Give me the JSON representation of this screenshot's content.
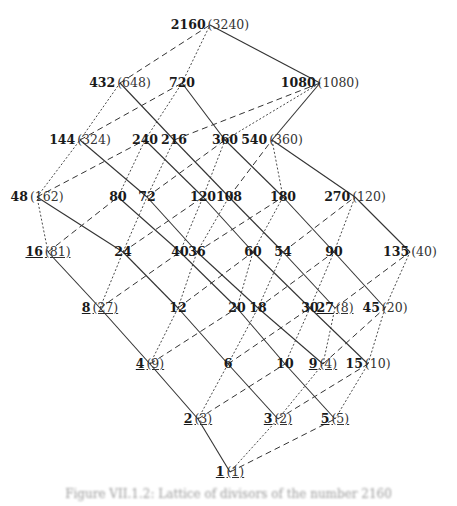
{
  "diagram": {
    "edge_styles": {
      "factor_2": "solid",
      "factor_3": "dotted",
      "factor_5": "dashed"
    },
    "nodes": [
      {
        "id": "2160",
        "label": "2160",
        "alt": "(3240)",
        "x": 210,
        "y": 25,
        "ul": false,
        "alt_ul": false
      },
      {
        "id": "432",
        "label": "432",
        "alt": "(648)",
        "x": 120,
        "y": 83,
        "ul": false,
        "alt_ul": false
      },
      {
        "id": "720",
        "label": "720",
        "alt": "",
        "x": 182,
        "y": 83,
        "ul": false,
        "alt_ul": false
      },
      {
        "id": "1080",
        "label": "1080",
        "alt": "(1080)",
        "x": 320,
        "y": 83,
        "ul": false,
        "alt_ul": false
      },
      {
        "id": "144",
        "label": "144",
        "alt": "(324)",
        "x": 80,
        "y": 140,
        "ul": false,
        "alt_ul": false
      },
      {
        "id": "240",
        "label": "240",
        "alt": "",
        "x": 145,
        "y": 140,
        "ul": false,
        "alt_ul": false
      },
      {
        "id": "216",
        "label": "216",
        "alt": "",
        "x": 174,
        "y": 140,
        "ul": false,
        "alt_ul": false
      },
      {
        "id": "360",
        "label": "360",
        "alt": "",
        "x": 225,
        "y": 140,
        "ul": false,
        "alt_ul": false
      },
      {
        "id": "540",
        "label": "540",
        "alt": "(360)",
        "x": 272,
        "y": 140,
        "ul": false,
        "alt_ul": false
      },
      {
        "id": "48",
        "label": "48",
        "alt": "(162)",
        "x": 37,
        "y": 197,
        "ul": false,
        "alt_ul": false
      },
      {
        "id": "80",
        "label": "80",
        "alt": "",
        "x": 118,
        "y": 197,
        "ul": false,
        "alt_ul": false
      },
      {
        "id": "72",
        "label": "72",
        "alt": "",
        "x": 147,
        "y": 197,
        "ul": false,
        "alt_ul": false
      },
      {
        "id": "120",
        "label": "120",
        "alt": "",
        "x": 203,
        "y": 197,
        "ul": false,
        "alt_ul": false
      },
      {
        "id": "108",
        "label": "108",
        "alt": "",
        "x": 229,
        "y": 197,
        "ul": false,
        "alt_ul": false
      },
      {
        "id": "180",
        "label": "180",
        "alt": "",
        "x": 283,
        "y": 197,
        "ul": false,
        "alt_ul": false
      },
      {
        "id": "270",
        "label": "270",
        "alt": "(120)",
        "x": 355,
        "y": 197,
        "ul": false,
        "alt_ul": false
      },
      {
        "id": "16",
        "label": "16",
        "alt": "(81)",
        "x": 48,
        "y": 252,
        "ul": true,
        "alt_ul": true
      },
      {
        "id": "24",
        "label": "24",
        "alt": "",
        "x": 123,
        "y": 252,
        "ul": false,
        "alt_ul": false
      },
      {
        "id": "40",
        "label": "40",
        "alt": "",
        "x": 180,
        "y": 252,
        "ul": false,
        "alt_ul": false
      },
      {
        "id": "36",
        "label": "36",
        "alt": "",
        "x": 197,
        "y": 252,
        "ul": false,
        "alt_ul": false
      },
      {
        "id": "60",
        "label": "60",
        "alt": "",
        "x": 253,
        "y": 252,
        "ul": false,
        "alt_ul": false
      },
      {
        "id": "54",
        "label": "54",
        "alt": "",
        "x": 283,
        "y": 252,
        "ul": false,
        "alt_ul": false
      },
      {
        "id": "90",
        "label": "90",
        "alt": "",
        "x": 334,
        "y": 252,
        "ul": false,
        "alt_ul": false
      },
      {
        "id": "135",
        "label": "135",
        "alt": "(40)",
        "x": 410,
        "y": 252,
        "ul": false,
        "alt_ul": false
      },
      {
        "id": "8",
        "label": "8",
        "alt": "(27)",
        "x": 100,
        "y": 308,
        "ul": true,
        "alt_ul": true
      },
      {
        "id": "12",
        "label": "12",
        "alt": "",
        "x": 178,
        "y": 308,
        "ul": false,
        "alt_ul": false
      },
      {
        "id": "20",
        "label": "20",
        "alt": "",
        "x": 237,
        "y": 308,
        "ul": false,
        "alt_ul": false
      },
      {
        "id": "18",
        "label": "18",
        "alt": "",
        "x": 258,
        "y": 308,
        "ul": false,
        "alt_ul": false
      },
      {
        "id": "30",
        "label": "30",
        "alt": "",
        "x": 310,
        "y": 308,
        "ul": false,
        "alt_ul": false
      },
      {
        "id": "27",
        "label": "27",
        "alt": "(8)",
        "x": 335,
        "y": 308,
        "ul": true,
        "alt_ul": true
      },
      {
        "id": "45",
        "label": "45",
        "alt": "(20)",
        "x": 385,
        "y": 308,
        "ul": false,
        "alt_ul": false
      },
      {
        "id": "4",
        "label": "4",
        "alt": "(9)",
        "x": 150,
        "y": 364,
        "ul": true,
        "alt_ul": true
      },
      {
        "id": "6",
        "label": "6",
        "alt": "",
        "x": 228,
        "y": 364,
        "ul": false,
        "alt_ul": false
      },
      {
        "id": "10",
        "label": "10",
        "alt": "",
        "x": 285,
        "y": 364,
        "ul": false,
        "alt_ul": false
      },
      {
        "id": "9",
        "label": "9",
        "alt": "(4)",
        "x": 323,
        "y": 364,
        "ul": true,
        "alt_ul": true
      },
      {
        "id": "15",
        "label": "15",
        "alt": "(10)",
        "x": 368,
        "y": 364,
        "ul": false,
        "alt_ul": false
      },
      {
        "id": "2",
        "label": "2",
        "alt": "(3)",
        "x": 198,
        "y": 419,
        "ul": true,
        "alt_ul": true
      },
      {
        "id": "3",
        "label": "3",
        "alt": "(2)",
        "x": 278,
        "y": 419,
        "ul": true,
        "alt_ul": true
      },
      {
        "id": "5",
        "label": "5",
        "alt": "(5)",
        "x": 335,
        "y": 419,
        "ul": true,
        "alt_ul": true
      },
      {
        "id": "1",
        "label": "1",
        "alt": "(1)",
        "x": 230,
        "y": 472,
        "ul": true,
        "alt_ul": true
      }
    ]
  },
  "caption": "Figure VII.1.2: Lattice of divisors of the number 2160"
}
